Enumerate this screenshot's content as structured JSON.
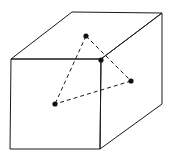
{
  "diagram": {
    "type": "cube-with-inscribed-triangle",
    "colors": {
      "background": "#ffffff",
      "stroke": "#1a1a1a",
      "point": "#111111"
    },
    "cube": {
      "front_face": [
        [
          11,
          59
        ],
        [
          101,
          59
        ],
        [
          100,
          149
        ],
        [
          10,
          149
        ]
      ],
      "top_face": [
        [
          11,
          59
        ],
        [
          72,
          12
        ],
        [
          162,
          13
        ],
        [
          101,
          59
        ]
      ],
      "right_face": [
        [
          101,
          59
        ],
        [
          162,
          13
        ],
        [
          162,
          104
        ],
        [
          100,
          149
        ]
      ]
    },
    "points": [
      {
        "id": "P1",
        "x": 86,
        "y": 36,
        "location": "top face"
      },
      {
        "id": "P2",
        "x": 101,
        "y": 60,
        "location": "front top-right vertex"
      },
      {
        "id": "P3",
        "x": 131,
        "y": 81,
        "location": "right face"
      },
      {
        "id": "P4",
        "x": 55,
        "y": 104,
        "location": "front face"
      }
    ],
    "dashed_edges": [
      [
        "P1",
        "P4"
      ],
      [
        "P1",
        "P3"
      ],
      [
        "P3",
        "P4"
      ]
    ]
  }
}
